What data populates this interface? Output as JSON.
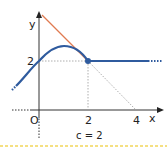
{
  "diagram": {
    "axes": {
      "x_label": "x",
      "y_label": "y",
      "origin_label": "O",
      "x_ticks": [
        "2",
        "4"
      ],
      "y_ticks": [
        "2"
      ]
    },
    "caption": "c = 2",
    "colors": {
      "curve": "#2f5b9e",
      "tangent": "#e07a50",
      "axis": "#333333",
      "guide": "#999999",
      "separator": "#f2d65a"
    },
    "elements": {
      "curve": "smooth curve rising through (0,2), peak near (1,2.6), returning to point (2,2), then constant y=2 for x>2",
      "tangent": "tangent line from near (0,4) down to (2,2), extended dotted to (4,0)",
      "point": "(2,2)"
    }
  }
}
